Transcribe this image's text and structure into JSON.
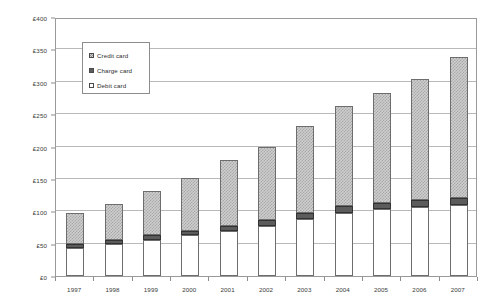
{
  "chart_data": {
    "type": "bar",
    "stacked": true,
    "title": "",
    "subtitle": "",
    "xlabel": "",
    "ylabel": "",
    "ylim": [
      0,
      400
    ],
    "ytick_step": 50,
    "ytick_labels": [
      "£0",
      "£50",
      "£100",
      "£150",
      "£200",
      "£250",
      "£300",
      "£350",
      "£400"
    ],
    "ytick_values": [
      0,
      50,
      100,
      150,
      200,
      250,
      300,
      350,
      400
    ],
    "grid": true,
    "grid_axis": "y",
    "legend_position": "upper-left-inside",
    "currency_symbol": "£",
    "categories": [
      "1997",
      "1998",
      "1999",
      "2000",
      "2001",
      "2002",
      "2003",
      "2004",
      "2005",
      "2006",
      "2007"
    ],
    "series": [
      {
        "name": "Debit card",
        "swatch": "debit",
        "fill": "#ffffff",
        "values": [
          43,
          49,
          56,
          63,
          70,
          78,
          88,
          98,
          103,
          106,
          110
        ]
      },
      {
        "name": "Charge card",
        "swatch": "charge",
        "fill": "#5c5c5c",
        "values": [
          6,
          6,
          7,
          7,
          8,
          9,
          10,
          10,
          10,
          11,
          11
        ]
      },
      {
        "name": "Credit card",
        "swatch": "credit",
        "fill": "#cfcfcf",
        "values": [
          49,
          56,
          69,
          82,
          101,
          113,
          134,
          154,
          170,
          188,
          217
        ]
      }
    ],
    "totals": [
      98,
      111,
      132,
      152,
      179,
      200,
      232,
      262,
      283,
      305,
      338
    ]
  },
  "legend": {
    "items": [
      {
        "label": "Credit card",
        "swatch": "credit"
      },
      {
        "label": "Charge card",
        "swatch": "charge"
      },
      {
        "label": "Debit card",
        "swatch": "debit"
      }
    ]
  }
}
